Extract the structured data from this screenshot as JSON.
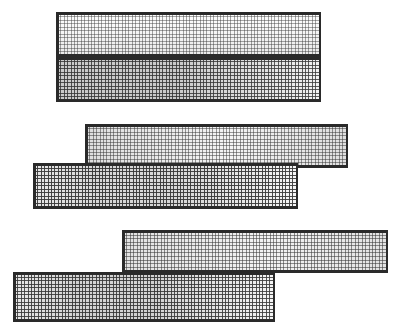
{
  "figure": {
    "title": "",
    "width": 407,
    "height": 333,
    "background": "#ffffff"
  },
  "chart_data": {
    "type": "heatmap",
    "title": "",
    "subtitle": "",
    "xlabel": "",
    "ylabel": "",
    "legend": [],
    "annotations": [],
    "grid": true,
    "axis_visible": false,
    "tick_labels": [],
    "cell_size_px": 3.4,
    "line_color": "#555555",
    "border_color": "#2a2a2a",
    "panels": [
      {
        "id": "panel-1",
        "name": "top-upper-mesh",
        "x": 56,
        "y": 12,
        "width": 265,
        "height": 45,
        "cols": 78,
        "rows": 13,
        "shading": "vertical-light",
        "gradient_from": "#ffffff",
        "gradient_to": "#e8e8e8",
        "line_opacity": 0.45,
        "mean_value": 0.18
      },
      {
        "id": "panel-2",
        "name": "top-lower-mesh",
        "x": 56,
        "y": 57,
        "width": 265,
        "height": 45,
        "cols": 78,
        "rows": 13,
        "shading": "vertical-dark",
        "gradient_from": "#c9c9c9",
        "gradient_to": "#f2f2f2",
        "line_opacity": 0.8,
        "mean_value": 0.52
      },
      {
        "id": "panel-3",
        "name": "middle-upper-mesh",
        "x": 85,
        "y": 124,
        "width": 263,
        "height": 44,
        "cols": 77,
        "rows": 13,
        "shading": "horizontal-light",
        "gradient_from": "#f4f4f4",
        "gradient_to": "#dedede",
        "line_opacity": 0.5,
        "mean_value": 0.24
      },
      {
        "id": "panel-4",
        "name": "middle-lower-mesh",
        "x": 33,
        "y": 163,
        "width": 265,
        "height": 46,
        "cols": 78,
        "rows": 13,
        "shading": "horizontal-dark",
        "gradient_from": "#d6d6d6",
        "gradient_to": "#f6f6f6",
        "line_opacity": 0.9,
        "mean_value": 0.66
      },
      {
        "id": "panel-5",
        "name": "bottom-upper-mesh",
        "x": 122,
        "y": 230,
        "width": 266,
        "height": 43,
        "cols": 78,
        "rows": 12,
        "shading": "horizontal-light",
        "gradient_from": "#f2f2f2",
        "gradient_to": "#e2e2e2",
        "line_opacity": 0.55,
        "mean_value": 0.27
      },
      {
        "id": "panel-6",
        "name": "bottom-lower-mesh",
        "x": 13,
        "y": 272,
        "width": 262,
        "height": 50,
        "cols": 77,
        "rows": 14,
        "shading": "horizontal-dark",
        "gradient_from": "#d2d2d2",
        "gradient_to": "#f4f4f4",
        "line_opacity": 0.85,
        "mean_value": 0.6
      }
    ]
  }
}
